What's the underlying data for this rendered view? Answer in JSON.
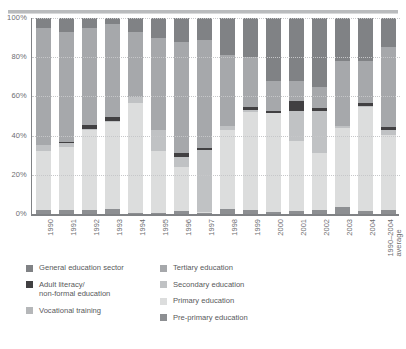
{
  "chart_data": {
    "type": "bar",
    "subtype": "stacked-100-percent",
    "title": "",
    "xlabel": "",
    "ylabel": "",
    "ylim": [
      0,
      100
    ],
    "yticks": [
      "0%",
      "20%",
      "40%",
      "60%",
      "80%",
      "100%"
    ],
    "ytick_values": [
      0,
      20,
      40,
      60,
      80,
      100
    ],
    "grid": true,
    "legend_position": "bottom",
    "categories": [
      "1990",
      "1991",
      "1992",
      "1993",
      "1994",
      "1995",
      "1996",
      "1997",
      "1998",
      "1999",
      "2000",
      "2001",
      "2002",
      "2003",
      "2004",
      "1990–2004\naverage"
    ],
    "series": [
      {
        "name": "Pre-primary education",
        "color": "#8d8f92",
        "values": [
          2.0,
          2.0,
          2.0,
          2.5,
          0.6,
          0.7,
          1.5,
          0.6,
          2.5,
          2.0,
          0.8,
          1.5,
          2.0,
          3.5,
          1.5,
          1.8
        ]
      },
      {
        "name": "Primary education",
        "color": "#dcdddd",
        "values": [
          30.0,
          32.0,
          41.0,
          44.5,
          56.0,
          31.5,
          22.5,
          0.4,
          40.5,
          50.0,
          50.5,
          35.5,
          29.0,
          40.5,
          53.0,
          38.5
        ]
      },
      {
        "name": "Secondary education",
        "color": "#c0c2c4",
        "values": [
          3.0,
          2.0,
          0.5,
          0.5,
          3.0,
          10.5,
          5.0,
          31.5,
          2.0,
          1.0,
          0.5,
          15.5,
          21.5,
          1.0,
          0.5,
          2.5
        ]
      },
      {
        "name": "Adult literacy/\nnon-formal education",
        "color": "#414042",
        "values": [
          0.0,
          0.6,
          2.0,
          1.8,
          0.0,
          0.0,
          2.0,
          1.0,
          0.0,
          1.5,
          1.0,
          5.0,
          1.5,
          0.0,
          1.5,
          1.5
        ]
      },
      {
        "name": "Tertiary education",
        "color": "#a6a8ab",
        "values": [
          60.0,
          56.4,
          49.5,
          47.7,
          33.4,
          47.3,
          57.0,
          55.5,
          36.0,
          25.5,
          15.2,
          10.5,
          11.0,
          33.0,
          21.5,
          40.7
        ]
      },
      {
        "name": "General education sector",
        "color": "#808285",
        "values": [
          5.0,
          7.0,
          5.0,
          3.0,
          7.0,
          10.0,
          12.0,
          11.0,
          19.0,
          20.0,
          32.0,
          32.0,
          35.0,
          22.0,
          22.0,
          15.0
        ]
      }
    ],
    "legend": [
      {
        "label": "General education sector",
        "color": "#808285"
      },
      {
        "label": "Adult literacy/\nnon-formal education",
        "color": "#414042"
      },
      {
        "label": "Vocational training",
        "color": "#b5b7b9"
      },
      {
        "label": "Tertiary education",
        "color": "#a6a8ab"
      },
      {
        "label": "Secondary education",
        "color": "#c0c2c4"
      },
      {
        "label": "Primary education",
        "color": "#dcdddd"
      },
      {
        "label": "Pre-primary education",
        "color": "#8d8f92"
      }
    ]
  },
  "axis": {
    "yticks": [
      {
        "label": "100%",
        "pos": 0
      },
      {
        "label": "80%",
        "pos": 20
      },
      {
        "label": "60%",
        "pos": 40
      },
      {
        "label": "40%",
        "pos": 60
      },
      {
        "label": "20%",
        "pos": 80
      },
      {
        "label": "0%",
        "pos": 100
      }
    ]
  },
  "legend_columns": [
    [
      {
        "label": "General education sector",
        "color": "#808285"
      },
      {
        "label": "Adult literacy/\nnon-formal education",
        "color": "#414042"
      },
      {
        "label": "Vocational training",
        "color": "#b5b7b9"
      }
    ],
    [
      {
        "label": "Tertiary education",
        "color": "#a6a8ab"
      },
      {
        "label": "Secondary education",
        "color": "#c0c2c4"
      },
      {
        "label": "Primary education",
        "color": "#dcdddd"
      },
      {
        "label": "Pre-primary education",
        "color": "#8d8f92"
      }
    ]
  ]
}
